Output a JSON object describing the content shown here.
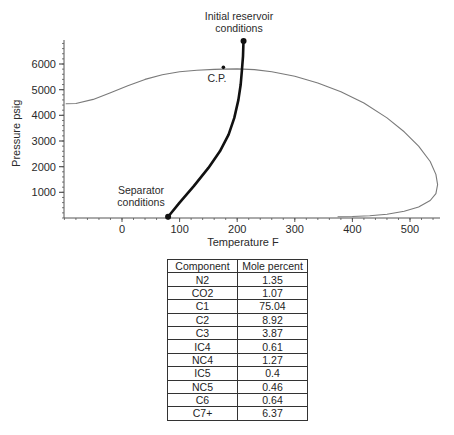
{
  "chart_data": {
    "type": "line",
    "title": "",
    "xlabel": "Temperature F",
    "ylabel": "Pressure psig",
    "xlim": [
      -100,
      550
    ],
    "ylim": [
      0,
      6900
    ],
    "x_ticks": [
      0,
      100,
      200,
      300,
      400,
      500
    ],
    "y_ticks": [
      1000,
      2000,
      3000,
      4000,
      5000,
      6000
    ],
    "grid": false,
    "series": [
      {
        "name": "Phase envelope",
        "style": "thin-gray",
        "x": [
          -97,
          -80,
          -50,
          -20,
          10,
          40,
          70,
          100,
          130,
          160,
          176,
          200,
          230,
          260,
          300,
          340,
          380,
          420,
          460,
          490,
          515,
          535,
          545,
          548,
          545,
          535,
          515,
          490,
          460,
          430,
          400,
          375
        ],
        "y": [
          4450,
          4460,
          4620,
          4880,
          5150,
          5400,
          5580,
          5700,
          5760,
          5790,
          5800,
          5810,
          5780,
          5700,
          5520,
          5260,
          4920,
          4480,
          3900,
          3360,
          2800,
          2200,
          1700,
          1300,
          950,
          680,
          430,
          260,
          150,
          90,
          60,
          50
        ]
      },
      {
        "name": "Production path",
        "style": "thick-black",
        "x": [
          80,
          100,
          125,
          150,
          170,
          185,
          195,
          202,
          206,
          208,
          210,
          211
        ],
        "y": [
          50,
          600,
          1250,
          1950,
          2600,
          3250,
          3900,
          4600,
          5200,
          5700,
          6300,
          6900
        ]
      }
    ],
    "points": [
      {
        "name": "C.P.",
        "x": 176,
        "y": 5870
      },
      {
        "name": "Initial reservoir conditions",
        "x": 211,
        "y": 6900
      },
      {
        "name": "Separator conditions",
        "x": 80,
        "y": 50
      }
    ],
    "annotations": [
      {
        "text": "Initial reservoir",
        "line": 1,
        "target": "Initial reservoir conditions"
      },
      {
        "text": "conditions",
        "line": 2,
        "target": "Initial reservoir conditions"
      },
      {
        "text": "C.P.",
        "target": "C.P."
      },
      {
        "text": "Separator",
        "line": 1,
        "target": "Separator conditions"
      },
      {
        "text": "conditions",
        "line": 2,
        "target": "Separator conditions"
      }
    ]
  },
  "table": {
    "headers": [
      "Component",
      "Mole percent"
    ],
    "rows": [
      [
        "N2",
        "1.35"
      ],
      [
        "CO2",
        "1.07"
      ],
      [
        "C1",
        "75.04"
      ],
      [
        "C2",
        "8.92"
      ],
      [
        "C3",
        "3.87"
      ],
      [
        "IC4",
        "0.61"
      ],
      [
        "NC4",
        "1.27"
      ],
      [
        "IC5",
        "0.4"
      ],
      [
        "NC5",
        "0.46"
      ],
      [
        "C6",
        "0.64"
      ],
      [
        "C7+",
        "6.37"
      ]
    ]
  },
  "colors": {
    "envelope": "#7a7a7a",
    "path": "#111111",
    "axis": "#555555",
    "text": "#2a2a2a"
  }
}
